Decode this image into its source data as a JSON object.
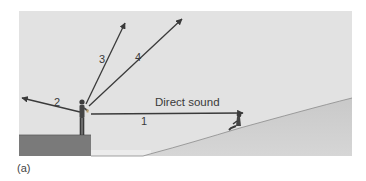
{
  "figure": {
    "caption": "(a)",
    "background_color": "#e2e2e2",
    "platform_color": "#7a7a7a",
    "hill_color": "#cfcfcf",
    "arrow_color": "#3a3a3a"
  },
  "rays": [
    {
      "id": "1",
      "label": "1",
      "description": "Direct sound"
    },
    {
      "id": "2",
      "label": "2"
    },
    {
      "id": "3",
      "label": "3"
    },
    {
      "id": "4",
      "label": "4"
    }
  ],
  "annotations": {
    "direct_sound": "Direct sound"
  },
  "elements": {
    "speaker": "person standing on platform",
    "listener": "person seated on hillside"
  }
}
